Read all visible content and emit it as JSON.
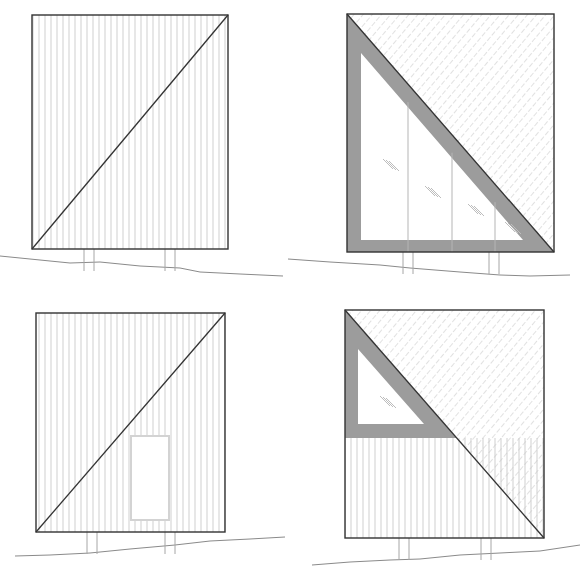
{
  "drawing": {
    "type": "architectural-elevations",
    "colors": {
      "background": "#ffffff",
      "outline": "#333333",
      "siding": "#cfcfcf",
      "hatch": "#c4c4c4",
      "frame": "#9c9c9c",
      "glass_mark": "#bdbdbd",
      "ground": "#8a8a8a",
      "post": "#a6a6a6",
      "door": "#d3d3d3"
    },
    "panels": [
      {
        "id": "elevation-1",
        "rect": [
          32,
          15,
          228,
          249
        ],
        "siding": "full",
        "diagonal": "bl-tr",
        "posts": [
          [
            84,
            94
          ],
          [
            165,
            175
          ]
        ],
        "ground": [
          [
            0,
            256
          ],
          [
            30,
            259
          ],
          [
            70,
            263
          ],
          [
            100,
            262
          ],
          [
            140,
            266
          ],
          [
            180,
            268
          ],
          [
            200,
            272
          ],
          [
            240,
            274
          ],
          [
            283,
            276
          ]
        ]
      },
      {
        "id": "elevation-2",
        "rect": [
          347,
          14,
          554,
          252
        ],
        "hatch_triangle": "upper-right",
        "diagonal": "tl-br",
        "frame_triangle": {
          "outer": [
            [
              347,
              14
            ],
            [
              554,
              252
            ],
            [
              347,
              252
            ]
          ],
          "inner": [
            [
              361,
              53
            ],
            [
              523,
              240
            ],
            [
              361,
              240
            ]
          ]
        },
        "mullions": [
          408,
          452,
          495
        ],
        "glass_marks": [
          [
            383,
            165
          ],
          [
            425,
            192
          ],
          [
            468,
            210
          ],
          [
            505,
            228
          ]
        ],
        "posts": [
          [
            403,
            413
          ],
          [
            489,
            499
          ]
        ],
        "ground": [
          [
            288,
            259
          ],
          [
            330,
            262
          ],
          [
            380,
            265
          ],
          [
            410,
            268
          ],
          [
            460,
            272
          ],
          [
            500,
            275
          ],
          [
            530,
            276
          ],
          [
            570,
            275
          ]
        ]
      },
      {
        "id": "elevation-3",
        "rect": [
          36,
          313,
          225,
          532
        ],
        "siding": "full",
        "diagonal": "bl-tr",
        "door": [
          131,
          436,
          169,
          520
        ],
        "posts": [
          [
            87,
            97
          ],
          [
            165,
            175
          ]
        ],
        "ground": [
          [
            15,
            556
          ],
          [
            50,
            555
          ],
          [
            90,
            553
          ],
          [
            130,
            549
          ],
          [
            175,
            545
          ],
          [
            210,
            541
          ],
          [
            250,
            539
          ],
          [
            285,
            537
          ]
        ]
      },
      {
        "id": "elevation-4",
        "rect": [
          345,
          310,
          544,
          538
        ],
        "hatch_triangle": "upper-right",
        "diagonal": "tl-br",
        "siding_below_y": 438,
        "frame_band": {
          "bottom_y": 438
        },
        "window": [
          [
            358,
            349
          ],
          [
            424,
            424
          ],
          [
            358,
            424
          ]
        ],
        "glass_marks": [
          [
            380,
            402
          ]
        ],
        "posts": [
          [
            399,
            409
          ],
          [
            481,
            491
          ]
        ],
        "ground": [
          [
            312,
            565
          ],
          [
            350,
            562
          ],
          [
            390,
            560
          ],
          [
            420,
            559
          ],
          [
            460,
            555
          ],
          [
            500,
            553
          ],
          [
            540,
            551
          ],
          [
            580,
            545
          ]
        ]
      }
    ]
  }
}
